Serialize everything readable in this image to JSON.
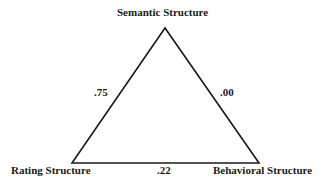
{
  "nodes": {
    "top": "Semantic Structure",
    "left": "Rating Structure",
    "right": "Behavioral Structure"
  },
  "edges": {
    "left_top": ".75",
    "top_right": ".00",
    "left_right": ".22"
  },
  "colors": {
    "line": "#1a1a1a",
    "background": "#ffffff"
  }
}
